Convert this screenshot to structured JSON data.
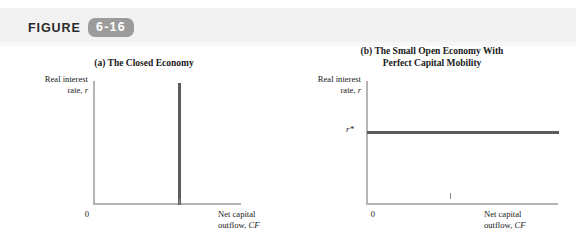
{
  "figure": {
    "label": "FIGURE",
    "number": "6-16",
    "badge_color": "#9b9b9b"
  },
  "panels": [
    {
      "id": "a",
      "title": "(a) The Closed Economy",
      "ylabel_line1": "Real interest",
      "ylabel_line2": "rate, ",
      "ylabel_symbol": "r",
      "xlabel_line1": "Net capital",
      "xlabel_line2": "outflow, ",
      "xlabel_symbol": "CF",
      "zero_tick_label": "0",
      "curve": {
        "type": "vertical-line",
        "name": "CF = 0",
        "color": "#5c5c5c"
      }
    },
    {
      "id": "b",
      "title_line1": "(b) The Small Open Economy With",
      "title_line2": "Perfect Capital Mobility",
      "ylabel_line1": "Real interest",
      "ylabel_line2": "rate, ",
      "ylabel_symbol": "r",
      "xlabel_line1": "Net capital",
      "xlabel_line2": "outflow, ",
      "xlabel_symbol": "CF",
      "zero_tick_label": "0",
      "rstar_label": "r*",
      "curve": {
        "type": "horizontal-line",
        "name": "r = r*",
        "color": "#5c5c5c"
      }
    }
  ],
  "chart_data": {
    "type": "line",
    "title": "FIGURE 6-16",
    "panels": [
      {
        "id": "a",
        "title": "(a) The Closed Economy",
        "xlabel": "Net capital outflow, CF",
        "ylabel": "Real interest rate, r",
        "xticks": [
          "0"
        ],
        "yticks": [],
        "grid": false,
        "legend": "none",
        "series": [
          {
            "name": "CF schedule (closed economy)",
            "orientation": "vertical",
            "x": [
              0,
              0
            ],
            "y": [
              0,
              1
            ],
            "note": "Net capital outflow fixed at zero for all real interest rates"
          }
        ]
      },
      {
        "id": "b",
        "title": "(b) The Small Open Economy With Perfect Capital Mobility",
        "xlabel": "Net capital outflow, CF",
        "ylabel": "Real interest rate, r",
        "xticks": [
          "0"
        ],
        "yticks": [
          "r*"
        ],
        "grid": false,
        "legend": "none",
        "series": [
          {
            "name": "r = r* schedule (small open economy)",
            "orientation": "horizontal",
            "x": [
              0,
              1
            ],
            "y": [
              "r*",
              "r*"
            ],
            "note": "Real interest rate fixed at the world rate r* for all levels of net capital outflow"
          }
        ]
      }
    ]
  }
}
